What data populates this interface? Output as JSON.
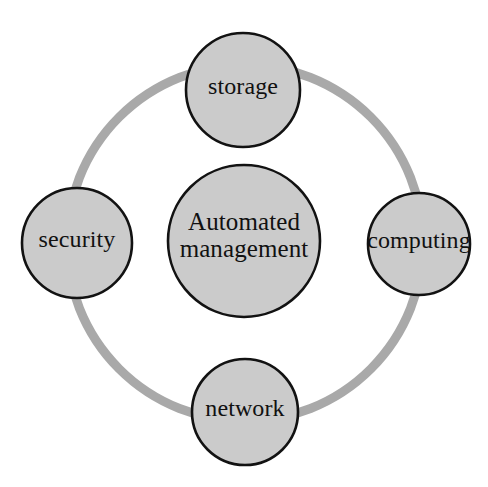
{
  "diagram": {
    "type": "cycle-hub-and-spoke",
    "title": "Automated management",
    "canvas": {
      "width": 488,
      "height": 487,
      "background": "#ffffff"
    },
    "style": {
      "node_fill": "#cbcbcb",
      "node_stroke": "#121212",
      "node_stroke_width": 2.6,
      "ring_color": "#a9a9a9",
      "ring_stroke_width": 9,
      "text_color": "#111111"
    },
    "ring": {
      "name": "connector-ring",
      "center_x": 245,
      "center_y": 243,
      "radius": 178,
      "color": "#a9a9a9",
      "stroke_width": 9
    },
    "center_node": {
      "id": "automated-management",
      "label_line1": "Automated",
      "label_line2": "management",
      "label": "Automated management",
      "cx": 244,
      "cy": 241,
      "r": 76,
      "fill": "#cbcbcb"
    },
    "nodes": [
      {
        "id": "storage",
        "label": "storage",
        "position": "top",
        "cx": 243,
        "cy": 90,
        "r": 57,
        "fill": "#cbcbcb"
      },
      {
        "id": "computing",
        "label": "computing",
        "position": "right",
        "cx": 419,
        "cy": 244,
        "r": 51,
        "fill": "#cbcbcb"
      },
      {
        "id": "network",
        "label": "network",
        "position": "bottom",
        "cx": 245,
        "cy": 412,
        "r": 53,
        "fill": "#cbcbcb"
      },
      {
        "id": "security",
        "label": "security",
        "position": "left",
        "cx": 77,
        "cy": 243,
        "r": 55,
        "fill": "#cbcbcb"
      }
    ]
  }
}
